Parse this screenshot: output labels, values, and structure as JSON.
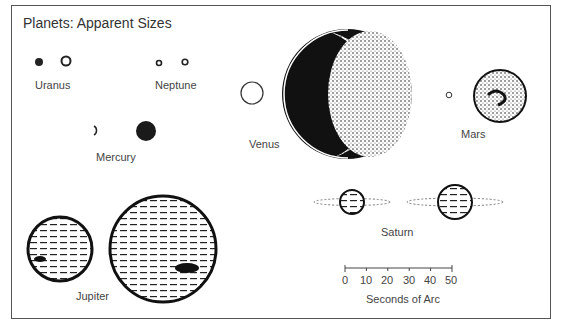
{
  "title": "Planets: Apparent Sizes",
  "planets": [
    {
      "name": "Uranus",
      "sizes_arcsec": [
        3.4,
        4.1
      ]
    },
    {
      "name": "Neptune",
      "sizes_arcsec": [
        2.2,
        2.4
      ]
    },
    {
      "name": "Venus",
      "sizes_arcsec": [
        10,
        66
      ]
    },
    {
      "name": "Mars",
      "sizes_arcsec": [
        3.5,
        25
      ]
    },
    {
      "name": "Mercury",
      "sizes_arcsec": [
        5,
        13
      ]
    },
    {
      "name": "Saturn",
      "sizes_arcsec": [
        15,
        21
      ]
    },
    {
      "name": "Jupiter",
      "sizes_arcsec": [
        30,
        50
      ]
    }
  ],
  "scale": {
    "label": "Seconds of Arc",
    "ticks": [
      "0",
      "10",
      "20",
      "30",
      "40",
      "50"
    ]
  }
}
